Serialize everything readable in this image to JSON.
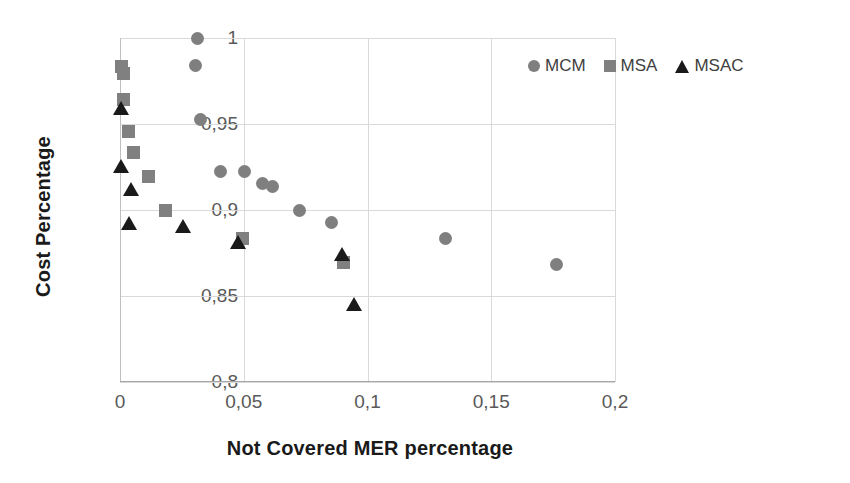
{
  "chart_data": {
    "type": "scatter",
    "title": "",
    "xlabel": "Not Covered MER percentage",
    "ylabel": "Cost Percentage",
    "xlim": [
      0,
      0.2
    ],
    "ylim": [
      0.8,
      1.0
    ],
    "xticks": [
      "0",
      "0,05",
      "0,1",
      "0,15",
      "0,2"
    ],
    "xtick_values": [
      0,
      0.05,
      0.1,
      0.15,
      0.2
    ],
    "yticks": [
      "0,8",
      "0,85",
      "0,9",
      "0,95",
      "1"
    ],
    "ytick_values": [
      0.8,
      0.85,
      0.9,
      0.95,
      1.0
    ],
    "grid": true,
    "legend_position": "top-right",
    "decimal_separator": ",",
    "series": [
      {
        "name": "MCM",
        "marker": "circle",
        "color": "#7f7f7f",
        "points": [
          {
            "x": 0.0315,
            "y": 1.0
          },
          {
            "x": 0.0305,
            "y": 0.984
          },
          {
            "x": 0.0325,
            "y": 0.9525
          },
          {
            "x": 0.0405,
            "y": 0.9225
          },
          {
            "x": 0.0505,
            "y": 0.9225
          },
          {
            "x": 0.0575,
            "y": 0.9155
          },
          {
            "x": 0.0615,
            "y": 0.9135
          },
          {
            "x": 0.0725,
            "y": 0.8995
          },
          {
            "x": 0.0855,
            "y": 0.8925
          },
          {
            "x": 0.1315,
            "y": 0.8835
          },
          {
            "x": 0.1765,
            "y": 0.8685
          }
        ]
      },
      {
        "name": "MSA",
        "marker": "square",
        "color": "#808080",
        "points": [
          {
            "x": 0.0005,
            "y": 0.9835
          },
          {
            "x": 0.0015,
            "y": 0.9795
          },
          {
            "x": 0.0015,
            "y": 0.9645
          },
          {
            "x": 0.0035,
            "y": 0.9455
          },
          {
            "x": 0.0055,
            "y": 0.9335
          },
          {
            "x": 0.0115,
            "y": 0.9195
          },
          {
            "x": 0.0185,
            "y": 0.8995
          },
          {
            "x": 0.0495,
            "y": 0.8835
          },
          {
            "x": 0.0905,
            "y": 0.8695
          }
        ]
      },
      {
        "name": "MSAC",
        "marker": "triangle",
        "color": "#1a1a1a",
        "points": [
          {
            "x": 0.0005,
            "y": 0.9595
          },
          {
            "x": 0.0005,
            "y": 0.9255
          },
          {
            "x": 0.0045,
            "y": 0.9125
          },
          {
            "x": 0.0035,
            "y": 0.8925
          },
          {
            "x": 0.0255,
            "y": 0.8905
          },
          {
            "x": 0.0475,
            "y": 0.8815
          },
          {
            "x": 0.0895,
            "y": 0.8745
          },
          {
            "x": 0.0945,
            "y": 0.8455
          }
        ]
      }
    ],
    "legend": [
      {
        "label": "MCM",
        "marker": "circle"
      },
      {
        "label": "MSA",
        "marker": "square"
      },
      {
        "label": "MSAC",
        "marker": "triangle"
      }
    ]
  }
}
